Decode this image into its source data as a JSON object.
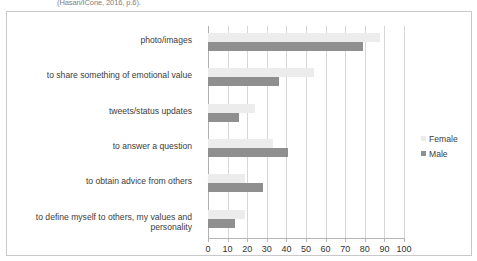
{
  "caption": {
    "text": "(Hasan/ICone, 2016, p.6)."
  },
  "legend": {
    "position": "right",
    "entries": [
      {
        "label": "Female",
        "color": "#ececec",
        "icon": "square-swatch-icon"
      },
      {
        "label": "Male",
        "color": "#8f8f8f",
        "icon": "square-swatch-icon"
      }
    ]
  },
  "chart_data": {
    "type": "bar",
    "orientation": "horizontal",
    "title": "",
    "xlabel": "",
    "ylabel": "",
    "xlim": [
      0,
      100
    ],
    "xticks": [
      0,
      10,
      20,
      30,
      40,
      50,
      60,
      70,
      80,
      90,
      100
    ],
    "grid": true,
    "legend_position": "right",
    "categories": [
      "photo/images",
      "to share something of emotional value",
      "tweets/status updates",
      "to answer a question",
      "to obtain advice from others",
      "to define myself to others, my values and personality"
    ],
    "series": [
      {
        "name": "Female",
        "color": "#ececec",
        "values": [
          88,
          54,
          24,
          33,
          19,
          19
        ]
      },
      {
        "name": "Male",
        "color": "#8f8f8f",
        "values": [
          79,
          36,
          16,
          41,
          28,
          14
        ]
      }
    ]
  }
}
